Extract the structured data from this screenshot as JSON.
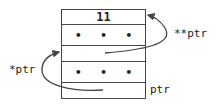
{
  "diagram": {
    "cells": [
      {
        "label": "11",
        "kind": "value"
      },
      {
        "label": "• • •",
        "kind": "ellipsis"
      },
      {
        "label": "",
        "kind": "pointer-slot"
      },
      {
        "label": "• • •",
        "kind": "ellipsis"
      },
      {
        "label": "",
        "kind": "pointer-slot"
      }
    ],
    "labels": {
      "double_ptr": "**ptr",
      "single_ptr": "*ptr",
      "ptr": "ptr"
    },
    "colors": {
      "stroke": "#444444",
      "text": "#222222"
    }
  }
}
